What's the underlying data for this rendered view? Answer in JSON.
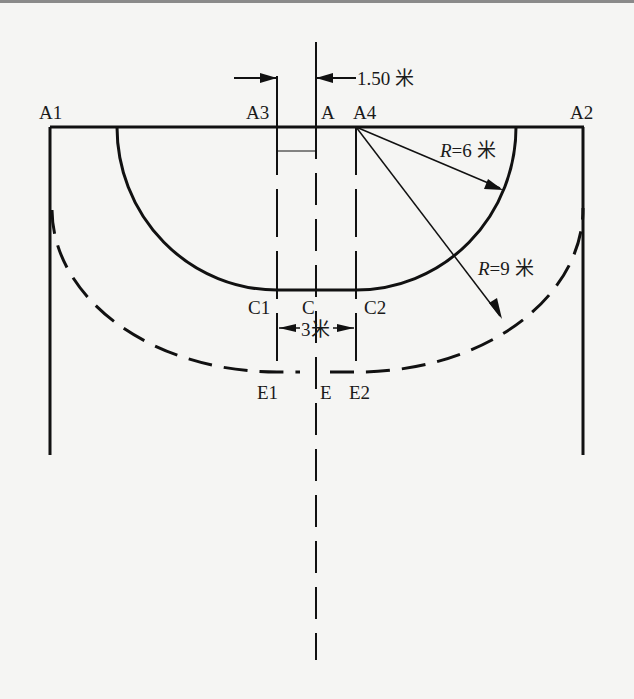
{
  "diagram": {
    "dimension_top": "1.50 米",
    "dimension_middle": "3米",
    "radius_inner": {
      "var": "R",
      "eq": "=6 米"
    },
    "radius_outer": {
      "var": "R",
      "eq": "=9 米"
    },
    "points": {
      "A1": "A1",
      "A2": "A2",
      "A3": "A3",
      "A": "A",
      "A4": "A4",
      "C1": "C1",
      "C": "C",
      "C2": "C2",
      "E1": "E1",
      "E": "E",
      "E2": "E2"
    },
    "colors": {
      "line": "#111111",
      "background": "#f5f5f3"
    }
  }
}
